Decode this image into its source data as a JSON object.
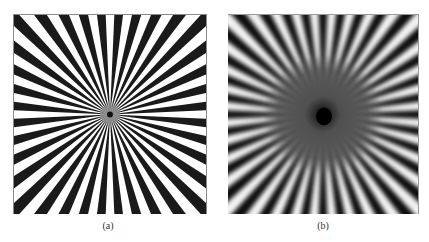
{
  "figure": {
    "panels": [
      {
        "id": "a",
        "caption": "(a)",
        "description": "Siemens star test pattern, sharp black/white radial spokes",
        "spoke_count": 36,
        "colors": {
          "dark": "#1a1a1a",
          "light": "#ffffff"
        }
      },
      {
        "id": "b",
        "caption": "(b)",
        "description": "Blurred / low-pass filtered Siemens star with aliasing ring near center",
        "spoke_count": 36,
        "colors": {
          "dark": "#0e0e0e",
          "light": "#f2f2f2",
          "mid": "#555555"
        }
      }
    ]
  }
}
